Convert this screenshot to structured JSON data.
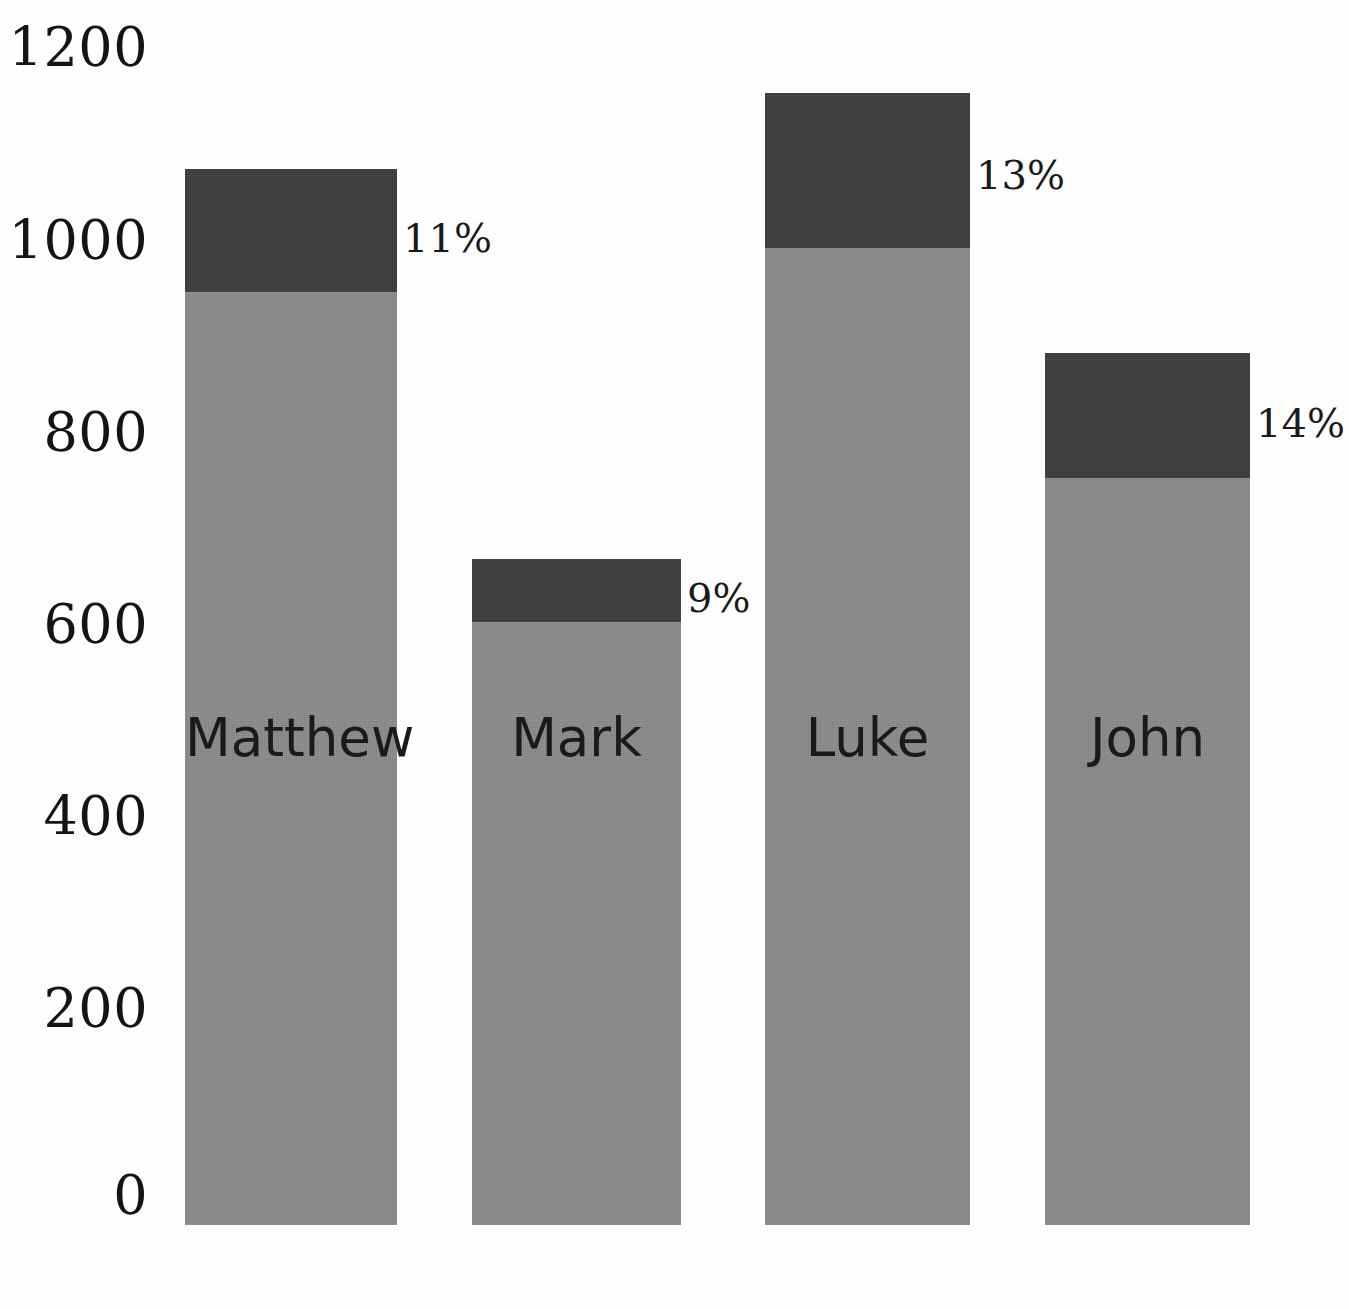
{
  "chart_data": {
    "type": "bar",
    "subtype": "stacked-bar",
    "title": "",
    "xlabel": "",
    "ylabel": "",
    "categories": [
      "Matthew",
      "Mark",
      "Luke",
      "John"
    ],
    "series": [
      {
        "name": "lower",
        "values": [
          960,
          610,
          995,
          755
        ]
      },
      {
        "name": "upper",
        "values": [
          120,
          65,
          165,
          125
        ]
      }
    ],
    "totals": [
      1080,
      675,
      1160,
      880
    ],
    "data_labels": [
      "11%",
      "9%",
      "13%",
      "14%"
    ],
    "ylim": [
      0,
      1200
    ],
    "yticks": [
      1200,
      1000,
      800,
      600,
      400,
      200,
      0
    ],
    "ytick_labels": [
      "1200",
      "1000",
      "800",
      "600",
      "400",
      "200",
      "0"
    ],
    "grid": false,
    "legend": "none",
    "colors": {
      "lower": "#8b8b8b",
      "upper": "#3b3b3b",
      "text": "#1a1a1a",
      "background": "#ffffff"
    }
  },
  "axis": {
    "ticks": [
      {
        "label": "1200",
        "y": 48
      },
      {
        "label": "1000",
        "y": 241
      },
      {
        "label": "800",
        "y": 433
      },
      {
        "label": "600",
        "y": 625
      },
      {
        "label": "400",
        "y": 817
      },
      {
        "label": "200",
        "y": 1009
      },
      {
        "label": "0",
        "y": 1196
      }
    ]
  },
  "bars": [
    {
      "name": "Matthew",
      "label": "Matthew",
      "pct": "11%",
      "left": 185,
      "width": 212,
      "top": 169,
      "split": 292,
      "baseline": 1225,
      "pct_x": 403,
      "pct_y": 238,
      "name_y": 737
    },
    {
      "name": "Mark",
      "label": "Mark",
      "pct": "9%",
      "left": 472,
      "width": 209,
      "top": 559,
      "split": 622,
      "baseline": 1225,
      "pct_x": 687,
      "pct_y": 598,
      "name_y": 737
    },
    {
      "name": "Luke",
      "label": "Luke",
      "pct": "13%",
      "left": 765,
      "width": 205,
      "top": 93,
      "split": 248,
      "baseline": 1225,
      "pct_x": 976,
      "pct_y": 175,
      "name_y": 737
    },
    {
      "name": "John",
      "label": "John",
      "pct": "14%",
      "left": 1045,
      "width": 205,
      "top": 353,
      "split": 478,
      "baseline": 1225,
      "pct_x": 1256,
      "pct_y": 423,
      "name_y": 737
    }
  ]
}
